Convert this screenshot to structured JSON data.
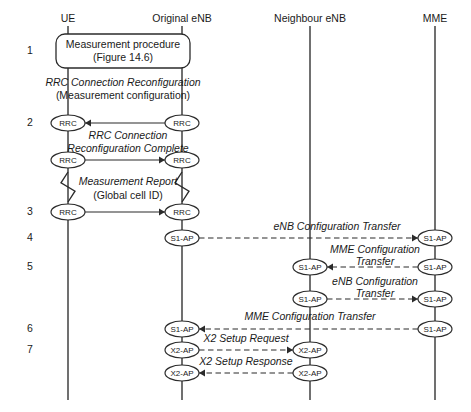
{
  "figure": {
    "background": "#ffffff",
    "line_color": "#2b2b2b",
    "width": 471,
    "height": 412
  },
  "lifelines": [
    {
      "id": "ue",
      "label": "UE",
      "x": 68,
      "top": 26,
      "bottom": 400
    },
    {
      "id": "oenb",
      "label": "Original eNB",
      "x": 182,
      "top": 26,
      "bottom": 400
    },
    {
      "id": "nenb",
      "label": "Neighbour eNB",
      "x": 310,
      "top": 26,
      "bottom": 400
    },
    {
      "id": "mme",
      "label": "MME",
      "x": 435,
      "top": 26,
      "bottom": 400
    }
  ],
  "steps": [
    {
      "number": "1",
      "y": 51
    },
    {
      "number": "2",
      "y": 123
    },
    {
      "number": "3",
      "y": 212
    },
    {
      "number": "4",
      "y": 238
    },
    {
      "number": "5",
      "y": 267
    },
    {
      "number": "6",
      "y": 329
    },
    {
      "number": "7",
      "y": 350
    }
  ],
  "step_number_x": 30,
  "procedure_box": {
    "line1": "Measurement procedure",
    "line2": "(Figure 14.6)",
    "x": 56,
    "y": 34,
    "width": 134,
    "height": 34
  },
  "annotations": [
    {
      "id": "rrc-reconfig",
      "line1": "RRC Connection Reconfiguration",
      "line2": "(Measurement configuration)",
      "x": 123,
      "y1": 83,
      "y2": 96,
      "italic_line1": true,
      "italic_line2": false
    },
    {
      "id": "rrc-reconfig-done",
      "line1": "RRC Connection",
      "line2": "Reconfiguration Complete",
      "x": 128,
      "y1": 136,
      "y2": 149,
      "italic_line1": true,
      "italic_line2": true
    },
    {
      "id": "meas-report",
      "line1": "Measurement Report",
      "line2": "(Global cell ID)",
      "x": 128,
      "y1": 182,
      "y2": 196,
      "italic_line1": true,
      "italic_line2": false
    },
    {
      "id": "enb-cfg-xfer-1",
      "line1": "eNB Configuration Transfer",
      "line2": "",
      "x": 337,
      "y1": 227,
      "y2": 0,
      "italic_line1": true,
      "italic_line2": false
    },
    {
      "id": "mme-cfg-xfer-1",
      "line1": "MME Configuration",
      "line2": "Transfer",
      "x": 375,
      "y1": 250,
      "y2": 262,
      "italic_line1": true,
      "italic_line2": true
    },
    {
      "id": "enb-cfg-xfer-2",
      "line1": "eNB Configuration",
      "line2": "Transfer",
      "x": 375,
      "y1": 282,
      "y2": 294,
      "italic_line1": true,
      "italic_line2": true
    },
    {
      "id": "mme-cfg-xfer-2",
      "line1": "MME Configuration Transfer",
      "line2": "",
      "x": 310,
      "y1": 317,
      "y2": 0,
      "italic_line1": true,
      "italic_line2": false
    },
    {
      "id": "x2-setup-request",
      "line1": "X2 Setup Request",
      "line2": "",
      "x": 246,
      "y1": 339,
      "y2": 0,
      "italic_line1": true,
      "italic_line2": false
    },
    {
      "id": "x2-setup-response",
      "line1": "X2 Setup Response",
      "line2": "",
      "x": 246,
      "y1": 362,
      "y2": 0,
      "italic_line1": true,
      "italic_line2": false
    }
  ],
  "messages": [
    {
      "id": "msg-rrc-reconfig",
      "protocol": "RRC",
      "from": "oenb",
      "to": "ue",
      "y": 123,
      "dashed": false
    },
    {
      "id": "msg-rrc-reconfig-done",
      "protocol": "RRC",
      "from": "ue",
      "to": "oenb",
      "y": 160,
      "dashed": false
    },
    {
      "id": "msg-meas-report",
      "protocol": "RRC",
      "from": "ue",
      "to": "oenb",
      "y": 212,
      "dashed": false
    },
    {
      "id": "msg-enb-cfg-1",
      "protocol": "S1-AP",
      "from": "oenb",
      "to": "mme",
      "y": 238,
      "dashed": true
    },
    {
      "id": "msg-mme-cfg-1",
      "protocol": "S1-AP",
      "from": "mme",
      "to": "nenb",
      "y": 267,
      "dashed": true
    },
    {
      "id": "msg-enb-cfg-2",
      "protocol": "S1-AP",
      "from": "nenb",
      "to": "mme",
      "y": 299,
      "dashed": true
    },
    {
      "id": "msg-mme-cfg-2",
      "protocol": "S1-AP",
      "from": "mme",
      "to": "oenb",
      "y": 329,
      "dashed": true
    },
    {
      "id": "msg-x2-request",
      "protocol": "X2-AP",
      "from": "oenb",
      "to": "nenb",
      "y": 350,
      "dashed": true
    },
    {
      "id": "msg-x2-response",
      "protocol": "X2-AP",
      "from": "nenb",
      "to": "oenb",
      "y": 373,
      "dashed": true
    }
  ],
  "zigzags": [
    {
      "id": "zz-ue",
      "x": 68,
      "y_top": 172,
      "y_bottom": 202
    },
    {
      "id": "zz-oenb",
      "x": 182,
      "y_top": 172,
      "y_bottom": 202
    }
  ],
  "ellipse": {
    "rx": 17,
    "ry": 8
  }
}
